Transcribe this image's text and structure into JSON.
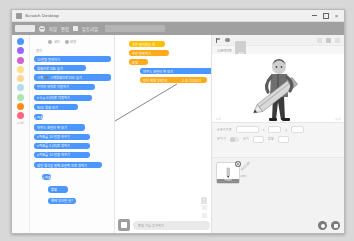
{
  "window": {
    "title": "Scratch Desktop",
    "icon": "scratch-app-icon",
    "minimize": "minimize-icon",
    "maximize": "maximize-icon",
    "close": "close-icon"
  },
  "menubar": {
    "logo": "scratch-logo",
    "globe_icon": "globe-icon",
    "language_label": "한국어",
    "items": [
      "파일",
      "편집"
    ],
    "tutorial_icon": "lightbulb-icon",
    "tutorial_label": "튜토리얼",
    "project_name_placeholder": "프로젝트 1",
    "project_name_value": "프로젝트 1"
  },
  "palette": {
    "tabs": [
      {
        "label": "코드",
        "icon": "code-icon"
      },
      {
        "label": "모양",
        "icon": "costume-icon"
      },
      {
        "label": "소리",
        "icon": "sound-icon"
      }
    ],
    "categories": [
      {
        "name": "동작",
        "color": "#4C97FF"
      },
      {
        "name": "형태",
        "color": "#9966FF"
      },
      {
        "name": "소리",
        "color": "#CF63CF"
      },
      {
        "name": "이벤트",
        "color": "#FFBF00"
      },
      {
        "name": "제어",
        "color": "#FFAB19"
      },
      {
        "name": "감지",
        "color": "#5CB1D6"
      },
      {
        "name": "연산",
        "color": "#59C059"
      },
      {
        "name": "변수",
        "color": "#FF8C1A"
      },
      {
        "name": "내 블록",
        "color": "#FF6680"
      }
    ],
    "section_header": "동작",
    "blocks": [
      {
        "label": "10 만큼 움직이기",
        "color": "#4C97FF",
        "shape": "stack"
      },
      {
        "label": "방향으로 15도 돌기",
        "color": "#4C97FF",
        "shape": "stack"
      },
      {
        "label": "시계방향으로 15도 돌기",
        "color": "#4C97FF",
        "shape": "stack"
      },
      {
        "label": "무작위 위치로 이동하기",
        "color": "#4C97FF",
        "shape": "stack"
      },
      {
        "label": "x: 0 y: 0 (으)로 이동하기",
        "color": "#4C97FF",
        "shape": "stack"
      },
      {
        "label": "1 초 동안 무작위 위치로 이동하기",
        "color": "#4C97FF",
        "shape": "stack"
      },
      {
        "label": "90 도 방향 보기",
        "color": "#4C97FF",
        "shape": "stack"
      },
      {
        "label": "마우스 포인터 쪽 보기",
        "color": "#4C97FF",
        "shape": "stack"
      },
      {
        "label": "x 좌표를 10 만큼 바꾸기",
        "color": "#4C97FF",
        "shape": "stack"
      },
      {
        "label": "x 좌표를 0 (으)로 정하기",
        "color": "#4C97FF",
        "shape": "stack"
      },
      {
        "label": "y 좌표를 10 만큼 바꾸기",
        "color": "#4C97FF",
        "shape": "stack"
      },
      {
        "label": "y 좌표를 0 (으)로 정하기",
        "color": "#4C97FF",
        "shape": "stack"
      },
      {
        "label": "벽에 닿으면 튕기기",
        "color": "#4C97FF",
        "shape": "stack"
      },
      {
        "label": "회전 방식을 왼쪽-오른쪽 으로 정하기",
        "color": "#4C97FF",
        "shape": "stack"
      },
      {
        "label": "x 좌표",
        "color": "#4C97FF",
        "shape": "reporter"
      },
      {
        "label": "y 좌표",
        "color": "#4C97FF",
        "shape": "reporter"
      },
      {
        "label": "방향",
        "color": "#4C97FF",
        "shape": "reporter"
      }
    ],
    "extension_button": "확장 기능 추가하기",
    "extension_icon": "add-extension-icon"
  },
  "canvas": {
    "script_blocks": [
      {
        "label": "깃발 클릭했을 때",
        "color": "#FFBF00",
        "shape": "hat"
      },
      {
        "label": "무한 반복하기",
        "color": "#FFAB19",
        "shape": "c-block"
      },
      {
        "label": "모양",
        "color": "#FFAB19",
        "shape": "stack"
      },
      {
        "label": "마우스 포인터 쪽 보기",
        "color": "#4C97FF",
        "shape": "stack"
      },
      {
        "label": "10 만큼 움직이기",
        "color": "#4C97FF",
        "shape": "stack"
      },
      {
        "label": "만약 벽에 닿았다면 튕기기",
        "color": "#FFAB19",
        "shape": "stack"
      },
      {
        "label": "1 초 기다리기",
        "color": "#FFAB19",
        "shape": "stack"
      }
    ],
    "zoom_in": "zoom-in-icon",
    "zoom_out": "zoom-out-icon",
    "zoom_reset": "zoom-reset-icon",
    "trash": "trash-icon"
  },
  "stage": {
    "green_flag": "green-flag-icon",
    "stop": "stop-icon",
    "small_stage": "small-stage-icon",
    "large_stage": "large-stage-icon",
    "fullscreen": "fullscreen-icon",
    "header_label": "스프라이트",
    "header_badge": "무대",
    "sprite_name": "Pencil",
    "footer_left": "x: 0",
    "footer_right": "y: 0"
  },
  "sprite_info": {
    "name_label": "스프라이트",
    "name_value": "Pencil",
    "x_label": "x",
    "x_value": "0",
    "y_label": "y",
    "y_value": "0",
    "show_label": "보이기",
    "size_label": "크기",
    "size_value": "100",
    "direction_label": "방향",
    "direction_value": "90"
  },
  "sprite_pane": {
    "thumbnail_name": "Pencil",
    "badge_icon": "delete-sprite-icon",
    "paint_icon": "paint-brush-icon",
    "paint_label": "그리기",
    "add_sprite_button": "add-sprite-icon",
    "add_backdrop_button": "add-backdrop-icon"
  }
}
